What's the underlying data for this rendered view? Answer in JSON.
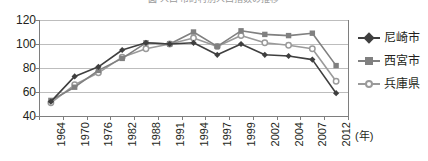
{
  "title_clipped": "図  人口  市町村別人口指数の推移",
  "axis": {
    "x_unit_label": "(年)",
    "y_ticks": [
      120,
      100,
      80,
      60,
      40
    ],
    "x_ticks": [
      "1964",
      "1970",
      "1976",
      "1982",
      "1988",
      "1991",
      "1994",
      "1997",
      "1999",
      "2002",
      "2004",
      "2007",
      "2012"
    ]
  },
  "legend": {
    "items": [
      {
        "label": "尼崎市",
        "marker": "diamond-marker",
        "color": "#3f3f3f"
      },
      {
        "label": "西宮市",
        "marker": "square-marker",
        "color": "#808080"
      },
      {
        "label": "兵庫県",
        "marker": "open-circle-marker",
        "color": "#9a9a9a"
      }
    ]
  },
  "chart_data": {
    "type": "line",
    "title": "図  人口  市町村別人口指数の推移",
    "xlabel": "(年)",
    "ylabel": "",
    "ylim": [
      40,
      120
    ],
    "grid": true,
    "legend_position": "right",
    "categories": [
      "1964",
      "1970",
      "1976",
      "1982",
      "1988",
      "1991",
      "1994",
      "1997",
      "1999",
      "2002",
      "2004",
      "2007",
      "2012"
    ],
    "series": [
      {
        "name": "尼崎市",
        "color": "#3f3f3f",
        "marker": "diamond",
        "values": [
          52,
          73,
          81,
          95,
          101,
          100,
          101,
          91,
          100,
          91,
          90,
          87,
          59
        ]
      },
      {
        "name": "西宮市",
        "color": "#808080",
        "marker": "square",
        "values": [
          53,
          64,
          78,
          88,
          101,
          100,
          110,
          98,
          111,
          108,
          107,
          109,
          82
        ]
      },
      {
        "name": "兵庫県",
        "color": "#9a9a9a",
        "marker": "open-circle",
        "values": [
          51,
          66,
          76,
          89,
          96,
          100,
          105,
          98,
          107,
          101,
          99,
          96,
          69
        ]
      }
    ]
  }
}
